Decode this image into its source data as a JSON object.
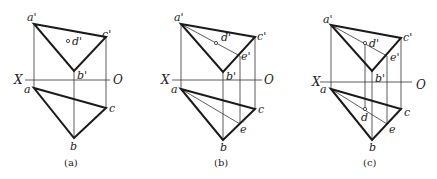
{
  "figure": {
    "axis_labels": {
      "x": "X",
      "o": "O"
    },
    "panels": [
      {
        "id": "a",
        "caption": "(a)",
        "labels": {
          "a_prime": "a'",
          "b_prime": "b'",
          "c_prime": "c'",
          "d_prime": "d'",
          "a": "a",
          "b": "b",
          "c": "c"
        }
      },
      {
        "id": "b",
        "caption": "(b)",
        "labels": {
          "a_prime": "a'",
          "b_prime": "b'",
          "c_prime": "c'",
          "d_prime": "d'",
          "e_prime": "e'",
          "a": "a",
          "b": "b",
          "c": "c",
          "e": "e"
        }
      },
      {
        "id": "c",
        "caption": "(c)",
        "labels": {
          "a_prime": "a'",
          "b_prime": "b'",
          "c_prime": "c'",
          "d_prime": "d'",
          "e_prime": "e'",
          "a": "a",
          "b": "b",
          "c": "c",
          "d": "d",
          "e": "e"
        }
      }
    ]
  }
}
